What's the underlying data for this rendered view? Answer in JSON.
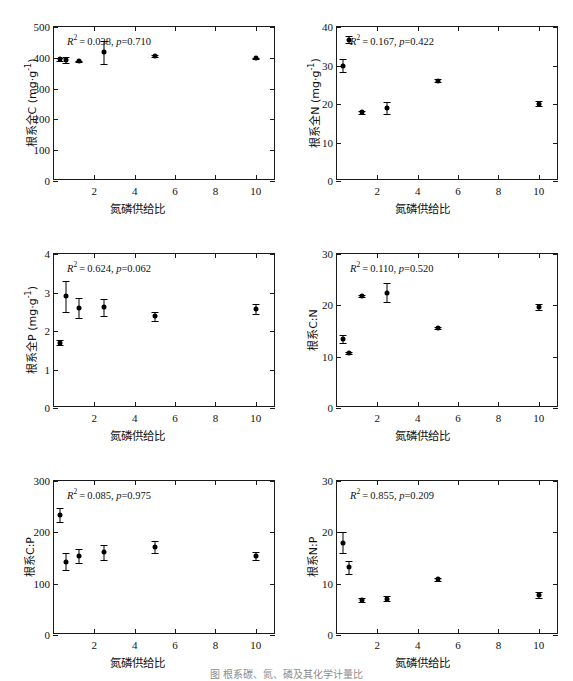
{
  "figure": {
    "caption": "图   根系碳、氮、磷及其化学计量比",
    "xlabel_common": "氮磷供给比"
  },
  "chart_data": [
    {
      "id": "root-total-c",
      "type": "scatter",
      "title": "",
      "xlabel": "氮磷供给比",
      "ylabel": "根系全C (mg·g⁻¹)",
      "ylabel_main": "根系全C",
      "ylabel_unit": "(mg·g",
      "ylabel_exp": "-1",
      "xlim": [
        0,
        11
      ],
      "ylim": [
        0,
        500
      ],
      "xticks": [
        2,
        4,
        6,
        8,
        10
      ],
      "yticks": [
        0,
        100,
        200,
        300,
        400,
        500
      ],
      "grid": false,
      "annotation": "R² = 0.038, p = 0.710",
      "r2": "0.038",
      "p": "0.710",
      "x": [
        0.3,
        0.6,
        1.25,
        2.5,
        5,
        10
      ],
      "values": [
        395,
        393,
        388,
        418,
        405,
        398
      ],
      "errors": [
        4,
        10,
        3,
        38,
        3,
        2
      ]
    },
    {
      "id": "root-total-n",
      "type": "scatter",
      "title": "",
      "xlabel": "氮磷供给比",
      "ylabel": "根系全N (mg·g⁻¹)",
      "ylabel_main": "根系全N",
      "ylabel_unit": "(mg·g",
      "ylabel_exp": "-1",
      "xlim": [
        0,
        11
      ],
      "ylim": [
        0,
        40
      ],
      "xticks": [
        2,
        4,
        6,
        8,
        10
      ],
      "yticks": [
        0,
        10,
        20,
        30,
        40
      ],
      "grid": false,
      "annotation": "R² = 0.167, p = 0.422",
      "r2": "0.167",
      "p": "0.422",
      "x": [
        0.3,
        0.6,
        1.25,
        2.5,
        5,
        10
      ],
      "values": [
        30.0,
        36.7,
        17.8,
        18.9,
        26.1,
        20.1
      ],
      "errors": [
        1.8,
        0.9,
        0.3,
        1.5,
        0.3,
        0.7
      ]
    },
    {
      "id": "root-total-p",
      "type": "scatter",
      "title": "",
      "xlabel": "氮磷供给比",
      "ylabel": "根系全P (mg·g⁻¹)",
      "ylabel_main": "根系全P",
      "ylabel_unit": "(mg·g",
      "ylabel_exp": "-1",
      "xlim": [
        0,
        11
      ],
      "ylim": [
        0,
        4
      ],
      "xticks": [
        2,
        4,
        6,
        8,
        10
      ],
      "yticks": [
        0,
        1,
        2,
        3,
        4
      ],
      "grid": false,
      "annotation": "R² = 0.624, p = 0.062",
      "r2": "0.624",
      "p": "0.062",
      "x": [
        0.3,
        0.6,
        1.25,
        2.5,
        5,
        10
      ],
      "values": [
        1.7,
        2.9,
        2.59,
        2.62,
        2.38,
        2.58
      ],
      "errors": [
        0.06,
        0.4,
        0.26,
        0.22,
        0.12,
        0.13
      ]
    },
    {
      "id": "root-cn-ratio",
      "type": "scatter",
      "title": "",
      "xlabel": "氮磷供给比",
      "ylabel": "根系C:N",
      "ylabel_main": "根系C:N",
      "ylabel_unit": "",
      "ylabel_exp": "",
      "xlim": [
        0,
        11
      ],
      "ylim": [
        0,
        30
      ],
      "xticks": [
        2,
        4,
        6,
        8,
        10
      ],
      "yticks": [
        0,
        10,
        20,
        30
      ],
      "grid": false,
      "annotation": "R² = 0.110, p = 0.520",
      "r2": "0.110",
      "p": "0.520",
      "x": [
        0.3,
        0.6,
        1.25,
        2.5,
        5,
        10
      ],
      "values": [
        13.4,
        10.8,
        21.8,
        22.5,
        15.5,
        19.7
      ],
      "errors": [
        0.8,
        0.2,
        0.2,
        1.9,
        0.2,
        0.6
      ]
    },
    {
      "id": "root-cp-ratio",
      "type": "scatter",
      "title": "",
      "xlabel": "氮磷供给比",
      "ylabel": "根系C:P",
      "ylabel_main": "根系C:P",
      "ylabel_unit": "",
      "ylabel_exp": "",
      "xlim": [
        0,
        11
      ],
      "ylim": [
        0,
        300
      ],
      "xticks": [
        2,
        4,
        6,
        8,
        10
      ],
      "yticks": [
        0,
        100,
        200,
        300
      ],
      "grid": false,
      "annotation": "R² = 0.085, p = 0.975",
      "r2": "0.085",
      "p": "0.975",
      "x": [
        0.3,
        0.6,
        1.25,
        2.5,
        5,
        10
      ],
      "values": [
        234,
        143,
        154,
        161,
        171,
        154
      ],
      "errors": [
        14,
        16,
        14,
        15,
        12,
        8
      ]
    },
    {
      "id": "root-np-ratio",
      "type": "scatter",
      "title": "",
      "xlabel": "氮磷供给比",
      "ylabel": "根系N:P",
      "ylabel_main": "根系N:P",
      "ylabel_unit": "",
      "ylabel_exp": "",
      "xlim": [
        0,
        11
      ],
      "ylim": [
        0,
        30
      ],
      "xticks": [
        2,
        4,
        6,
        8,
        10
      ],
      "yticks": [
        0,
        10,
        20,
        30
      ],
      "grid": false,
      "annotation": "R² = 0.855, p = 0.209",
      "r2": "0.855",
      "p": "0.209",
      "x": [
        0.3,
        0.6,
        1.25,
        2.5,
        5,
        10
      ],
      "values": [
        18.0,
        13.2,
        6.9,
        7.1,
        10.9,
        7.8
      ],
      "errors": [
        2.0,
        1.3,
        0.4,
        0.5,
        0.3,
        0.6
      ]
    }
  ]
}
